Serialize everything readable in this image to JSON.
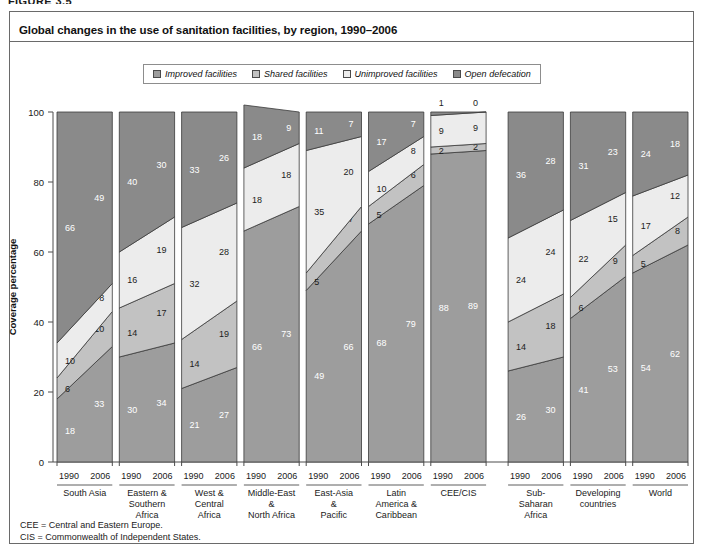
{
  "figure_tag": "FIGURE 3.5",
  "chart_title": "Global changes in the use of sanitation facilities, by region, 1990–2006",
  "legend": [
    {
      "label": "Improved facilities",
      "color": "#9d9d9d",
      "key": "improved"
    },
    {
      "label": "Shared facilities",
      "color": "#c2c2c2",
      "key": "shared"
    },
    {
      "label": "Unimproved facilities",
      "color": "#ececec",
      "key": "unimproved"
    },
    {
      "label": "Open defecation",
      "color": "#8a8a8a",
      "key": "open"
    }
  ],
  "footnotes": [
    "CEE = Central and Eastern Europe.",
    "CIS = Commonwealth of Independent States."
  ],
  "chart_data": {
    "type": "area",
    "title": "Global changes in the use of sanitation facilities, by region, 1990–2006",
    "xlabel": "",
    "ylabel": "Coverage percentage",
    "ylim": [
      0,
      100
    ],
    "yticks": [
      0,
      20,
      40,
      60,
      80,
      100
    ],
    "grid": false,
    "legend_position": "top-center",
    "x": [
      "1990",
      "2006"
    ],
    "stack_order": [
      "improved",
      "shared",
      "unimproved",
      "open"
    ],
    "series": [
      {
        "name": "Improved facilities",
        "key": "improved",
        "color": "#9d9d9d"
      },
      {
        "name": "Shared facilities",
        "key": "shared",
        "color": "#c2c2c2"
      },
      {
        "name": "Unimproved facilities",
        "key": "unimproved",
        "color": "#ececec"
      },
      {
        "name": "Open defecation",
        "key": "open",
        "color": "#8a8a8a"
      }
    ],
    "groups": [
      {
        "label": "South Asia",
        "label_lines": [
          "South Asia"
        ],
        "gap_before": false,
        "values": {
          "improved": [
            18,
            33
          ],
          "shared": [
            6,
            10
          ],
          "unimproved": [
            10,
            8
          ],
          "open": [
            66,
            49
          ]
        },
        "show_labels": {
          "improved": [
            true,
            true
          ],
          "shared": [
            true,
            true
          ],
          "unimproved": [
            true,
            true
          ],
          "open": [
            true,
            true
          ]
        }
      },
      {
        "label": "Eastern & Southern Africa",
        "label_lines": [
          "Eastern &",
          "Southern",
          "Africa"
        ],
        "gap_before": false,
        "values": {
          "improved": [
            30,
            34
          ],
          "shared": [
            14,
            17
          ],
          "unimproved": [
            16,
            19
          ],
          "open": [
            40,
            30
          ]
        },
        "show_labels": {
          "improved": [
            true,
            true
          ],
          "shared": [
            true,
            true
          ],
          "unimproved": [
            true,
            true
          ],
          "open": [
            true,
            true
          ]
        }
      },
      {
        "label": "West & Central Africa",
        "label_lines": [
          "West &",
          "Central",
          "Africa"
        ],
        "gap_before": false,
        "values": {
          "improved": [
            21,
            27
          ],
          "shared": [
            14,
            19
          ],
          "unimproved": [
            32,
            28
          ],
          "open": [
            33,
            26
          ]
        },
        "show_labels": {
          "improved": [
            true,
            true
          ],
          "shared": [
            true,
            true
          ],
          "unimproved": [
            true,
            true
          ],
          "open": [
            true,
            true
          ]
        }
      },
      {
        "label": "Middle-East & North Africa",
        "label_lines": [
          "Middle-East",
          "&",
          "North Africa"
        ],
        "gap_before": false,
        "values": {
          "improved": [
            66,
            73
          ],
          "shared": [
            0,
            0
          ],
          "unimproved": [
            18,
            18
          ],
          "open": [
            18,
            9
          ]
        },
        "show_labels": {
          "improved": [
            true,
            true
          ],
          "shared": [
            false,
            false
          ],
          "unimproved": [
            true,
            true
          ],
          "open": [
            true,
            true
          ]
        }
      },
      {
        "label": "East-Asia & Pacific",
        "label_lines": [
          "East-Asia",
          "&",
          "Pacific"
        ],
        "gap_before": false,
        "values": {
          "improved": [
            49,
            66
          ],
          "shared": [
            5,
            7
          ],
          "unimproved": [
            35,
            20
          ],
          "open": [
            11,
            7
          ]
        },
        "show_labels": {
          "improved": [
            true,
            true
          ],
          "shared": [
            true,
            true
          ],
          "unimproved": [
            true,
            true
          ],
          "open": [
            true,
            true
          ]
        }
      },
      {
        "label": "Latin America & Caribbean",
        "label_lines": [
          "Latin",
          "America &",
          "Caribbean"
        ],
        "gap_before": false,
        "values": {
          "improved": [
            68,
            79
          ],
          "shared": [
            5,
            6
          ],
          "unimproved": [
            10,
            8
          ],
          "open": [
            17,
            7
          ]
        },
        "show_labels": {
          "improved": [
            true,
            true
          ],
          "shared": [
            true,
            true
          ],
          "unimproved": [
            true,
            true
          ],
          "open": [
            true,
            true
          ]
        }
      },
      {
        "label": "CEE/CIS",
        "label_lines": [
          "CEE/CIS"
        ],
        "gap_before": false,
        "values": {
          "improved": [
            88,
            89
          ],
          "shared": [
            2,
            2
          ],
          "unimproved": [
            9,
            9
          ],
          "open": [
            1,
            0
          ]
        },
        "show_labels": {
          "improved": [
            true,
            true
          ],
          "shared": [
            true,
            true
          ],
          "unimproved": [
            true,
            true
          ],
          "open": [
            true,
            true
          ]
        },
        "open_labels_above": true
      },
      {
        "label": "Sub-Saharan Africa",
        "label_lines": [
          "Sub-",
          "Saharan",
          "Africa"
        ],
        "gap_before": true,
        "values": {
          "improved": [
            26,
            30
          ],
          "shared": [
            14,
            18
          ],
          "unimproved": [
            24,
            24
          ],
          "open": [
            36,
            28
          ]
        },
        "show_labels": {
          "improved": [
            true,
            true
          ],
          "shared": [
            true,
            true
          ],
          "unimproved": [
            true,
            true
          ],
          "open": [
            true,
            true
          ]
        }
      },
      {
        "label": "Developing countries",
        "label_lines": [
          "Developing",
          "countries"
        ],
        "gap_before": false,
        "values": {
          "improved": [
            41,
            53
          ],
          "shared": [
            6,
            9
          ],
          "unimproved": [
            22,
            15
          ],
          "open": [
            31,
            23
          ]
        },
        "show_labels": {
          "improved": [
            true,
            true
          ],
          "shared": [
            true,
            true
          ],
          "unimproved": [
            true,
            true
          ],
          "open": [
            true,
            true
          ]
        }
      },
      {
        "label": "World",
        "label_lines": [
          "World"
        ],
        "gap_before": false,
        "values": {
          "improved": [
            54,
            62
          ],
          "shared": [
            5,
            8
          ],
          "unimproved": [
            17,
            12
          ],
          "open": [
            24,
            18
          ]
        },
        "show_labels": {
          "improved": [
            true,
            true
          ],
          "shared": [
            true,
            true
          ],
          "unimproved": [
            true,
            true
          ],
          "open": [
            true,
            true
          ]
        }
      }
    ]
  }
}
